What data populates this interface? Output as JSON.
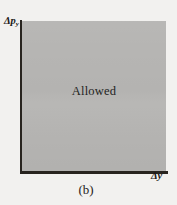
{
  "figure": {
    "caption": "(b)",
    "background_color": "#f2f1ef",
    "axis_color": "#28241f"
  },
  "axes": {
    "y": {
      "symbol": "Δp",
      "subscript": "y",
      "full_label": "Δpᵧ"
    },
    "x": {
      "symbol": "Δy",
      "full_label": "Δy"
    }
  },
  "region": {
    "label": "Allowed",
    "fill_color": "#b6b5b3"
  },
  "chart_data": {
    "type": "area",
    "title": "",
    "subtitle": "",
    "xlabel": "Δy",
    "ylabel": "Δpᵧ",
    "xlim": [
      0,
      1
    ],
    "ylim": [
      0,
      1
    ],
    "grid": false,
    "legend": null,
    "annotations": [
      {
        "text": "Allowed",
        "x": 0.5,
        "y": 0.53
      },
      {
        "text": "(b)",
        "x": 0.45,
        "y": -0.09
      }
    ],
    "series": [
      {
        "name": "Allowed",
        "description": "Entire first quadrant shaded as the allowed region",
        "x": [
          0,
          1,
          1,
          0
        ],
        "y": [
          0,
          0,
          1,
          1
        ],
        "fill": "#b6b5b3"
      }
    ],
    "xticks": [],
    "yticks": [],
    "xticklabels": [],
    "yticklabels": []
  }
}
